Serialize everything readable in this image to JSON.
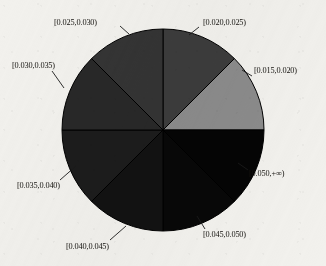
{
  "chart_data": {
    "type": "pie",
    "title": "",
    "subtitle": "",
    "xlabel": "",
    "ylabel": "",
    "legend_position": "none",
    "grid": false,
    "labels_outside": true,
    "start_angle_deg": 0,
    "direction": "clockwise",
    "categories": [
      "[0.020,0.025)",
      "[0.015,0.020)",
      "[0.050,+∞)",
      "[0.045,0.050)",
      "[0.040,0.045)",
      "[0.035,0.040)",
      "[0.030,0.035)",
      "[0.025,0.030)"
    ],
    "values": [
      12.5,
      12.5,
      12.5,
      12.5,
      12.5,
      12.5,
      12.5,
      12.5
    ],
    "value_unit": "percent",
    "slice_colors": [
      "#3c3c3c",
      "#8b8b8b",
      "#050505",
      "#080808",
      "#121212",
      "#1c1c1c",
      "#282828",
      "#343434"
    ],
    "slices": [
      {
        "label": "[0.020,0.025)",
        "value": 12.5,
        "start_angle_deg": 0,
        "end_angle_deg": 45,
        "color": "#3c3c3c",
        "label_x": 203,
        "label_y": 19,
        "leader": "M 199 27 L 189 35"
      },
      {
        "label": "[0.015,0.020)",
        "value": 12.5,
        "start_angle_deg": 45,
        "end_angle_deg": 90,
        "color": "#8b8b8b",
        "label_x": 254,
        "label_y": 67,
        "leader": "M 252 76 L 242 70"
      },
      {
        "label": "[0.050,+∞)",
        "value": 12.5,
        "start_angle_deg": 90,
        "end_angle_deg": 135,
        "color": "#050505",
        "label_x": 249,
        "label_y": 170,
        "leader": "M 248 170 L 238 163"
      },
      {
        "label": "[0.045,0.050)",
        "value": 12.5,
        "start_angle_deg": 135,
        "end_angle_deg": 180,
        "color": "#080808",
        "label_x": 203,
        "label_y": 231,
        "leader": "M 205 229 L 197 216"
      },
      {
        "label": "[0.040,0.045)",
        "value": 12.5,
        "start_angle_deg": 180,
        "end_angle_deg": 225,
        "color": "#121212",
        "label_x": 66,
        "label_y": 243,
        "leader": "M 110 240 L 126 226"
      },
      {
        "label": "[0.035,0.040)",
        "value": 12.5,
        "start_angle_deg": 225,
        "end_angle_deg": 270,
        "color": "#1c1c1c",
        "label_x": 17,
        "label_y": 182,
        "leader": "M 60 180 L 76 166"
      },
      {
        "label": "[0.030,0.035)",
        "value": 12.5,
        "start_angle_deg": 270,
        "end_angle_deg": 315,
        "color": "#282828",
        "label_x": 12,
        "label_y": 62,
        "leader": "M 52 71 L 64 88"
      },
      {
        "label": "[0.025,0.030)",
        "value": 12.5,
        "start_angle_deg": 315,
        "end_angle_deg": 360,
        "color": "#343434",
        "label_x": 54,
        "label_y": 19,
        "leader": "M 120 26 L 129 34"
      }
    ],
    "geometry": {
      "center_x": 163,
      "center_y": 130,
      "radius": 101
    }
  }
}
